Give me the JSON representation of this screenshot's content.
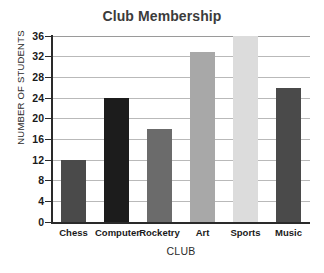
{
  "chart_data": {
    "type": "bar",
    "title": "Club Membership",
    "xlabel": "CLUB",
    "ylabel": "NUMBER OF STUDENTS",
    "categories": [
      "Chess",
      "Computer",
      "Rocketry",
      "Art",
      "Sports",
      "Music"
    ],
    "values": [
      12,
      24,
      18,
      33,
      36,
      26
    ],
    "bar_colors": [
      "#4a4a4a",
      "#1c1c1c",
      "#6b6b6b",
      "#a8a8a8",
      "#dcdcdc",
      "#4a4a4a"
    ],
    "ylim": [
      0,
      36
    ],
    "yticks": [
      0,
      4,
      8,
      12,
      16,
      20,
      24,
      28,
      32,
      36
    ],
    "ytick_labels": [
      "0",
      "4",
      "8",
      "12",
      "16",
      "20",
      "24",
      "28",
      "32",
      "36"
    ],
    "grid": true,
    "legend": null,
    "background_color": "#ffffff",
    "grid_color": "#b9b9b9",
    "axis_color": "#2a2a2a",
    "title_color": "#3b3b3b"
  }
}
